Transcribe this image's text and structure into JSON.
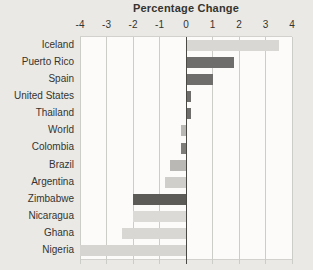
{
  "chart_data": {
    "type": "bar",
    "orientation": "horizontal",
    "title": "Percentage Change",
    "categories": [
      "Iceland",
      "Puerto Rico",
      "Spain",
      "United States",
      "Thailand",
      "World",
      "Colombia",
      "Brazil",
      "Argentina",
      "Zimbabwe",
      "Nicaragua",
      "Ghana",
      "Nigeria"
    ],
    "values": [
      3.5,
      1.8,
      1.0,
      0.2,
      0.2,
      -0.2,
      -0.2,
      -0.6,
      -0.8,
      -2.0,
      -2.0,
      -2.4,
      -4.0
    ],
    "bar_colors": [
      "#d8d7d3",
      "#6e6d6b",
      "#6e6d6b",
      "#6e6d6b",
      "#6e6d6b",
      "#b9b8b4",
      "#7e7d7a",
      "#b9b8b4",
      "#cfcecb",
      "#5c5b58",
      "#dbdad6",
      "#d8d7d3",
      "#d6d5d1"
    ],
    "xlim": [
      -4,
      4
    ],
    "x_ticks": [
      -4,
      -3,
      -2,
      -1,
      0,
      1,
      2,
      3,
      4
    ],
    "x_tick_labels": [
      "-4",
      "-3",
      "-2",
      "-1",
      "0",
      "1",
      "2",
      "3",
      "4"
    ],
    "xlabel": "",
    "ylabel": "",
    "grid": true,
    "legend": "none",
    "colors": {
      "background": "#eae9e5",
      "plot_background": "#fcfbf9",
      "gridline": "#ccccc8",
      "zero_line": "#4a4946",
      "text": "#35342f"
    }
  }
}
